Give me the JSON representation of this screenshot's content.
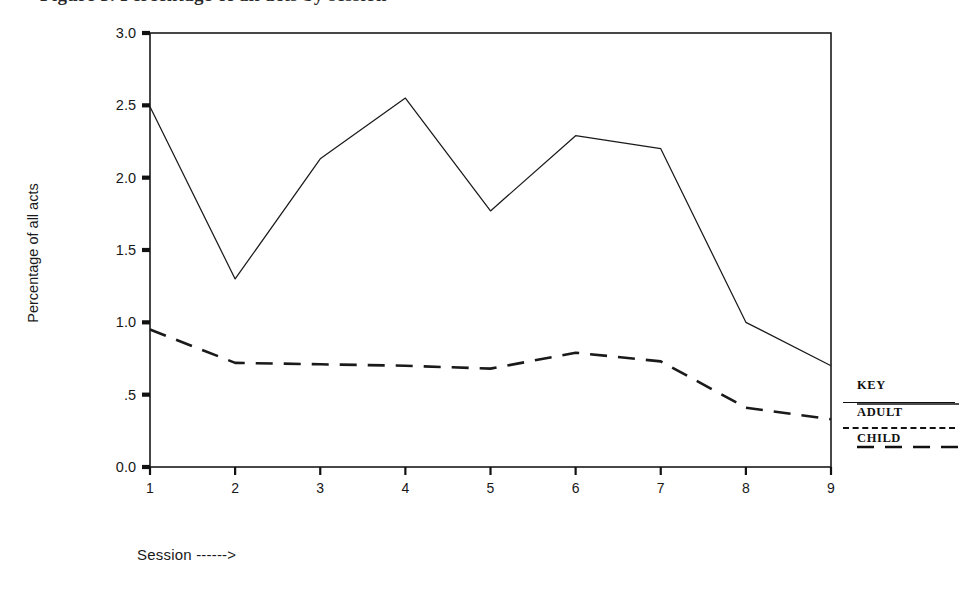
{
  "figure": {
    "title_cut_off": "Figure 3. Percentage of all acts by session",
    "ylabel": "Percentage of all acts",
    "xlabel": "Session ------>"
  },
  "legend": {
    "title": "KEY",
    "adult_label": "ADULT",
    "child_label": "CHILD"
  },
  "axes": {
    "y_ticks": [
      "3.0",
      "2.5",
      "2.0",
      "1.5",
      "1.0",
      ".5",
      "0.0"
    ],
    "x_ticks": [
      "1",
      "2",
      "3",
      "4",
      "5",
      "6",
      "7",
      "8",
      "9"
    ]
  },
  "chart_data": {
    "type": "line",
    "title": "",
    "xlabel": "Session ------>",
    "ylabel": "Percentage of all acts",
    "x": [
      1,
      2,
      3,
      4,
      5,
      6,
      7,
      8,
      9
    ],
    "xlim": [
      1,
      9
    ],
    "ylim": [
      0.0,
      3.0
    ],
    "ytick_values": [
      3.0,
      2.5,
      2.0,
      1.5,
      1.0,
      0.5,
      0.0
    ],
    "ytick_labels": [
      "3.0",
      "2.5",
      "2.0",
      "1.5",
      "1.0",
      ".5",
      "0.0"
    ],
    "xtick_values": [
      1,
      2,
      3,
      4,
      5,
      6,
      7,
      8,
      9
    ],
    "xtick_labels": [
      "1",
      "2",
      "3",
      "4",
      "5",
      "6",
      "7",
      "8",
      "9"
    ],
    "grid": false,
    "legend_position": "right",
    "series": [
      {
        "name": "ADULT",
        "style": "solid",
        "color": "#1a1a1a",
        "values": [
          2.49,
          1.3,
          2.13,
          2.55,
          1.77,
          2.29,
          2.2,
          1.0,
          0.7
        ]
      },
      {
        "name": "CHILD",
        "style": "dashed",
        "color": "#1a1a1a",
        "values": [
          0.95,
          0.72,
          0.71,
          0.7,
          0.68,
          0.79,
          0.73,
          0.41,
          0.33
        ]
      }
    ]
  }
}
